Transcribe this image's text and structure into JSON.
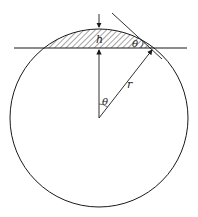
{
  "diagram": {
    "labels": {
      "height": "h",
      "angle_cap": "θ",
      "angle_center": "θ",
      "radius": "r"
    },
    "colors": {
      "stroke": "#1a1a1a",
      "hatch": "#333333",
      "background": "#ffffff"
    }
  }
}
